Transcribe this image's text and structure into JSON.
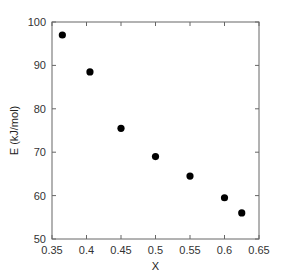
{
  "chart_data": {
    "type": "scatter",
    "title": "",
    "xlabel": "X",
    "ylabel": "E (kJ/mol)",
    "xlim": [
      0.35,
      0.65
    ],
    "ylim": [
      50,
      100
    ],
    "xticks": [
      0.35,
      0.4,
      0.45,
      0.5,
      0.55,
      0.6,
      0.65
    ],
    "xtick_labels": [
      "0.35",
      "0.4",
      "0.45",
      "0.5",
      "0.55",
      "0.6",
      "0.65"
    ],
    "yticks": [
      50,
      60,
      70,
      80,
      90,
      100
    ],
    "ytick_labels": [
      "50",
      "60",
      "70",
      "80",
      "90",
      "100"
    ],
    "grid": false,
    "legend": null,
    "series": [
      {
        "name": "E",
        "color": "#000000",
        "marker": "circle",
        "x": [
          0.365,
          0.405,
          0.45,
          0.5,
          0.55,
          0.6,
          0.625
        ],
        "y": [
          97,
          88.5,
          75.5,
          69,
          64.5,
          59.5,
          56
        ]
      }
    ]
  },
  "colors": {
    "axis": "#666666",
    "marker": "#000000",
    "background": "#ffffff"
  }
}
